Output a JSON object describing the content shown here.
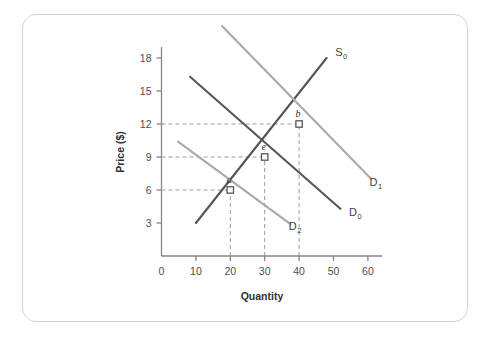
{
  "figure": {
    "background_color": "#ffffff",
    "card_border_color": "#d3d4d6"
  },
  "chart_data": {
    "type": "line",
    "title": "",
    "subtitle": "",
    "xlabel": "Quantity",
    "ylabel": "Price ($)",
    "xlim": [
      0,
      65
    ],
    "ylim": [
      0,
      19.5
    ],
    "xticks": [
      0,
      10,
      20,
      30,
      40,
      50,
      60
    ],
    "xtick_labels": [
      "0",
      "10",
      "20",
      "30",
      "40",
      "50",
      "60"
    ],
    "yticks": [
      3,
      6,
      9,
      12,
      15,
      18
    ],
    "ytick_labels": [
      "3",
      "6",
      "9",
      "12",
      "15",
      "18"
    ],
    "grid": false,
    "legend": "inline-curve-labels",
    "series": [
      {
        "name": "S0",
        "label": "S",
        "subscript": "0",
        "role": "supply",
        "color": "#55565a",
        "line_width": 2.1,
        "x": [
          10,
          48
        ],
        "y": [
          3,
          18
        ],
        "label_x": 50.5,
        "label_y": 18.2
      },
      {
        "name": "D0",
        "label": "D",
        "subscript": "0",
        "role": "demand-initial",
        "color": "#55565a",
        "line_width": 2.1,
        "x": [
          8.3,
          52
        ],
        "y": [
          16.3,
          4.3
        ],
        "label_x": 54.5,
        "label_y": 3.6
      },
      {
        "name": "D1",
        "label": "D",
        "subscript": "1",
        "role": "demand-increase",
        "color": "#a8a9ad",
        "line_width": 2.1,
        "x": [
          17.6,
          61
        ],
        "y": [
          20.9,
          7.0
        ],
        "label_x": 60.5,
        "label_y": 6.4
      },
      {
        "name": "D2",
        "label": "D",
        "subscript": "2",
        "role": "demand-decrease",
        "color": "#a8a9ad",
        "line_width": 2.1,
        "x": [
          4.8,
          37.5
        ],
        "y": [
          10.4,
          2.9
        ],
        "label_x": 37.0,
        "label_y": 2.4
      }
    ],
    "points": [
      {
        "name": "a",
        "label": "a",
        "x": 20,
        "y": 6,
        "marker": "open-square",
        "color": "#55565a"
      },
      {
        "name": "e",
        "label": "e",
        "x": 30,
        "y": 9,
        "marker": "open-square",
        "color": "#55565a"
      },
      {
        "name": "b",
        "label": "b",
        "x": 40,
        "y": 12,
        "marker": "open-square",
        "color": "#55565a"
      }
    ],
    "guide_lines": [
      {
        "name": "guide-price-12",
        "orientation": "horizontal",
        "value": 12,
        "from": 0,
        "to": 40,
        "style": "dashed"
      },
      {
        "name": "guide-price-9",
        "orientation": "horizontal",
        "value": 9,
        "from": 0,
        "to": 30,
        "style": "dashed"
      },
      {
        "name": "guide-price-6",
        "orientation": "horizontal",
        "value": 6,
        "from": 0,
        "to": 20,
        "style": "dashed"
      },
      {
        "name": "guide-qty-20",
        "orientation": "vertical",
        "value": 20,
        "from": 0,
        "to": 6,
        "style": "dashed"
      },
      {
        "name": "guide-qty-30",
        "orientation": "vertical",
        "value": 30,
        "from": 0,
        "to": 9,
        "style": "dashed"
      },
      {
        "name": "guide-qty-40",
        "orientation": "vertical",
        "value": 40,
        "from": 0,
        "to": 12,
        "style": "dashed"
      }
    ],
    "annotations": [
      {
        "text": "a",
        "at": [
          20,
          6
        ]
      },
      {
        "text": "e",
        "at": [
          30,
          9
        ]
      },
      {
        "text": "b",
        "at": [
          40,
          12
        ]
      }
    ],
    "axis_color": "#84858a",
    "dash_color": "#9a9b9f"
  }
}
